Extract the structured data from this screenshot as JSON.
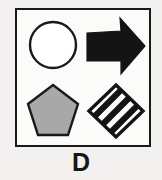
{
  "figure": {
    "label": "D",
    "panel": {
      "border_color": "#1a1a1a",
      "background_color": "#fbfbfa"
    },
    "background_color": "#f2f1ef",
    "shapes": [
      {
        "id": "circle",
        "name": "circle",
        "position": "top-left",
        "fill": "none",
        "fill_color": "#ffffff",
        "stroke_color": "#1a1a1a",
        "pattern": "none"
      },
      {
        "id": "arrow",
        "name": "right-arrow",
        "position": "top-right",
        "fill": "solid",
        "fill_color": "#141414",
        "stroke_color": "#141414",
        "pattern": "none",
        "direction": "right"
      },
      {
        "id": "pentagon",
        "name": "pentagon",
        "position": "bottom-left",
        "fill": "solid",
        "fill_color": "#a8a8a8",
        "stroke_color": "#1a1a1a",
        "pattern": "gray"
      },
      {
        "id": "diamond",
        "name": "diamond",
        "position": "bottom-right",
        "fill": "striped",
        "fill_color": "#141414",
        "stroke_color": "#141414",
        "pattern": "diagonal-stripes",
        "stripe_count": 4
      }
    ]
  }
}
